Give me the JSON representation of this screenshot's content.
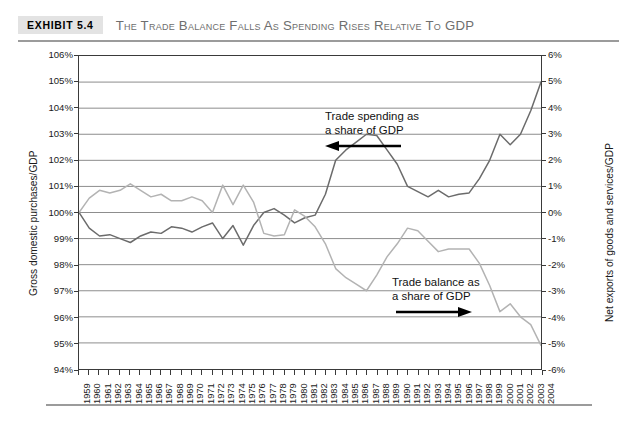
{
  "header": {
    "badge": "EXHIBIT 5.4",
    "title": "The Trade Balance Falls as Spending Rises Relative to GDP"
  },
  "chart_data": {
    "type": "line",
    "title": "The Trade Balance Falls as Spending Rises Relative to GDP",
    "xlabel": "",
    "ylabel": "Gross domestic purchases/GDP",
    "y2label": "Net exports of goods and services/GDP",
    "grid": true,
    "legend": "annotations",
    "ylim": [
      94,
      106
    ],
    "y2lim": [
      -6,
      6
    ],
    "ytick_labels": [
      "106%",
      "105%",
      "104%",
      "103%",
      "102%",
      "101%",
      "100%",
      "99%",
      "98%",
      "97%",
      "96%",
      "95%",
      "94%"
    ],
    "y2tick_labels": [
      "6%",
      "5%",
      "4%",
      "3%",
      "2%",
      "1%",
      "0%",
      "-1%",
      "-2%",
      "-3%",
      "-4%",
      "-5%",
      "-6%"
    ],
    "x": [
      1959,
      1960,
      1961,
      1962,
      1963,
      1964,
      1965,
      1966,
      1967,
      1968,
      1969,
      1970,
      1971,
      1972,
      1973,
      1974,
      1975,
      1976,
      1977,
      1978,
      1979,
      1980,
      1981,
      1982,
      1983,
      1984,
      1985,
      1986,
      1987,
      1988,
      1989,
      1990,
      1991,
      1992,
      1993,
      1994,
      1995,
      1996,
      1997,
      1998,
      1999,
      2000,
      2001,
      2002,
      2003,
      2004
    ],
    "categories": [
      "1959",
      "1960",
      "1961",
      "1962",
      "1963",
      "1964",
      "1965",
      "1966",
      "1967",
      "1968",
      "1969",
      "1970",
      "1971",
      "1972",
      "1973",
      "1974",
      "1975",
      "1976",
      "1977",
      "1978",
      "1979",
      "1980",
      "1981",
      "1982",
      "1983",
      "1984",
      "1985",
      "1986",
      "1987",
      "1988",
      "1989",
      "1990",
      "1991",
      "1992",
      "1993",
      "1994",
      "1995",
      "1996",
      "1997",
      "1998",
      "1999",
      "2000",
      "2001",
      "2002",
      "2003",
      "2004"
    ],
    "series": [
      {
        "name": "Trade spending as a share of GDP",
        "axis": "left",
        "color": "#6b6b6b",
        "units": "percent of GDP",
        "values": [
          100.0,
          99.4,
          99.1,
          99.15,
          99.0,
          98.85,
          99.1,
          99.25,
          99.2,
          99.45,
          99.4,
          99.25,
          99.45,
          99.6,
          99.0,
          99.5,
          98.75,
          99.5,
          100.0,
          100.15,
          99.9,
          99.6,
          99.8,
          99.9,
          100.7,
          102.0,
          102.4,
          102.7,
          103.0,
          102.95,
          102.4,
          101.85,
          101.0,
          100.8,
          100.6,
          100.85,
          100.6,
          100.7,
          100.75,
          101.3,
          102.0,
          103.0,
          102.6,
          103.0,
          103.9,
          105.0
        ]
      },
      {
        "name": "Trade balance as a share of GDP",
        "axis": "right",
        "color": "#b3b3b3",
        "units": "percent of GDP",
        "values": [
          0.0,
          0.55,
          0.85,
          0.75,
          0.85,
          1.1,
          0.85,
          0.6,
          0.7,
          0.45,
          0.45,
          0.6,
          0.45,
          0.0,
          1.05,
          0.3,
          1.05,
          0.4,
          -0.8,
          -0.9,
          -0.85,
          0.1,
          -0.15,
          -0.55,
          -1.2,
          -2.15,
          -2.5,
          -2.75,
          -3.0,
          -2.4,
          -1.7,
          -1.2,
          -0.6,
          -0.7,
          -1.1,
          -1.5,
          -1.4,
          -1.4,
          -1.4,
          -1.95,
          -2.8,
          -3.8,
          -3.5,
          -4.0,
          -4.3,
          -5.1
        ]
      }
    ],
    "annotations": [
      {
        "text_line1": "Trade spending as",
        "text_line2": "a share of GDP",
        "arrow": "left"
      },
      {
        "text_line1": "Trade balance as",
        "text_line2": "a share of GDP",
        "arrow": "right"
      }
    ]
  }
}
